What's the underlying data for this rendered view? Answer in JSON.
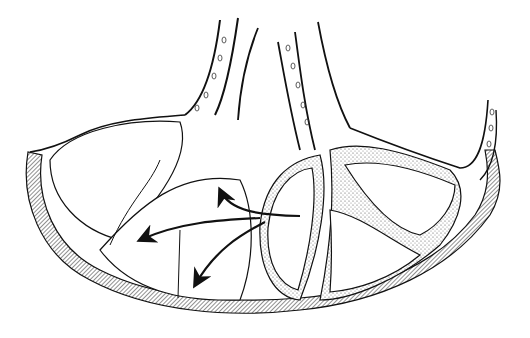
{
  "figure": {
    "type": "anatomical line illustration",
    "colors": {
      "ink": "#111111",
      "stipple": "#bdbdbd",
      "background": "#ffffff"
    },
    "labels": []
  }
}
